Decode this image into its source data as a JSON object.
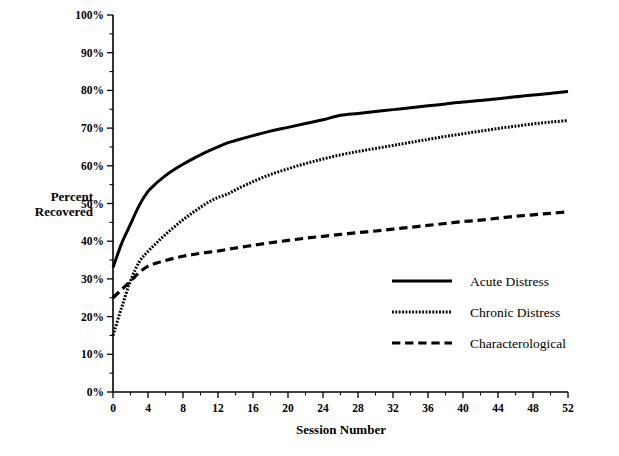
{
  "figure": {
    "background": "#ffffff",
    "ink_color": "#000000"
  },
  "axes": {
    "y_title_line1": "Percent",
    "y_title_line2": "Recovered",
    "x_title": "Session  Number",
    "y_ticks": [
      "0%",
      "10%",
      "20%",
      "30%",
      "40%",
      "50%",
      "60%",
      "70%",
      "80%",
      "90%",
      "100%"
    ],
    "x_ticks": [
      "0",
      "4",
      "8",
      "12",
      "16",
      "20",
      "24",
      "28",
      "32",
      "36",
      "40",
      "44",
      "48",
      "52"
    ]
  },
  "legend": {
    "entries": [
      {
        "label": "Acute Distress",
        "style": "solid"
      },
      {
        "label": "Chronic Distress",
        "style": "dotted"
      },
      {
        "label": "Characterological",
        "style": "dashed"
      }
    ]
  },
  "chart_data": {
    "type": "line",
    "title": "",
    "subtitle": "",
    "xlabel": "Session  Number",
    "ylabel": "Percent Recovered",
    "xlim": [
      0,
      52
    ],
    "ylim": [
      0,
      100
    ],
    "xtick_step": 4,
    "ytick_step": 10,
    "y_unit": "%",
    "grid": false,
    "legend_position": "center-right",
    "x": [
      0,
      1,
      2,
      3,
      4,
      5,
      6,
      7,
      8,
      9,
      10,
      11,
      12,
      13,
      14,
      16,
      18,
      20,
      22,
      24,
      26,
      28,
      30,
      32,
      34,
      36,
      38,
      40,
      42,
      44,
      46,
      48,
      50,
      52
    ],
    "series": [
      {
        "name": "Acute Distress",
        "style": "solid",
        "stroke_width": 3.0,
        "values": [
          33.0,
          39.5,
          44.5,
          49.5,
          53.2,
          55.5,
          57.4,
          59.0,
          60.4,
          61.7,
          62.9,
          64.0,
          65.0,
          66.0,
          66.7,
          68.0,
          69.2,
          70.2,
          71.2,
          72.2,
          73.4,
          73.9,
          74.4,
          74.9,
          75.4,
          75.9,
          76.4,
          76.9,
          77.3,
          77.8,
          78.3,
          78.8,
          79.2,
          79.7
        ]
      },
      {
        "name": "Chronic Distress",
        "style": "dotted",
        "stroke_width": 3.0,
        "values": [
          15.0,
          22.5,
          29.5,
          34.5,
          37.3,
          39.6,
          41.8,
          43.8,
          45.7,
          47.4,
          49.0,
          50.5,
          51.6,
          52.4,
          53.6,
          55.8,
          57.7,
          59.2,
          60.6,
          61.8,
          62.9,
          63.8,
          64.6,
          65.4,
          66.2,
          67.0,
          67.8,
          68.5,
          69.2,
          69.9,
          70.5,
          71.1,
          71.6,
          72.0
        ]
      },
      {
        "name": "Characterological",
        "style": "dashed",
        "stroke_width": 3.2,
        "values": [
          25.0,
          27.2,
          29.4,
          31.7,
          33.4,
          34.2,
          34.9,
          35.5,
          36.0,
          36.4,
          36.8,
          37.1,
          37.4,
          37.8,
          38.2,
          38.9,
          39.6,
          40.2,
          40.8,
          41.3,
          41.8,
          42.3,
          42.7,
          43.2,
          43.7,
          44.2,
          44.7,
          45.2,
          45.6,
          46.1,
          46.6,
          47.0,
          47.4,
          47.8
        ]
      }
    ]
  }
}
